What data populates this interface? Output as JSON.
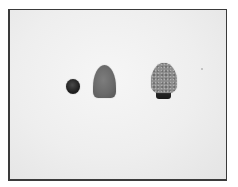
{
  "image": {
    "description": "Grayscale photograph of three small objects on a white background inside a dark-bordered frame",
    "frame_color": "#3a3a3a",
    "background_color": "#eeeeee",
    "objects": [
      {
        "name": "small dark sphere",
        "color": "#1f1f1f"
      },
      {
        "name": "smooth gray bullet-shaped object",
        "color": "#6a6a6a"
      },
      {
        "name": "textured bullet-shaped object on dark base",
        "color": "#8c8c8c",
        "base_color": "#222222"
      }
    ]
  }
}
